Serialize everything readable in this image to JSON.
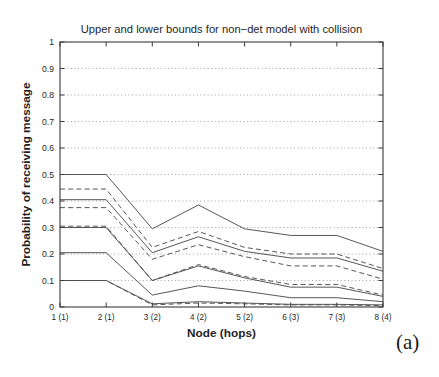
{
  "figure": {
    "caption": "(a)"
  },
  "chart_data": {
    "type": "line",
    "title": "Upper and lower bounds for non−det model with collision",
    "xlabel": "Node (hops)",
    "ylabel": "Probability of receiving message",
    "categories": [
      "1 (1)",
      "2 (1)",
      "3 (2)",
      "4 (2)",
      "5 (2)",
      "6 (3)",
      "7 (3)",
      "8 (4)"
    ],
    "x_tick_labels": [
      "1 (1)",
      "2 (1)",
      "3 (2)",
      "4 (2)",
      "5 (2)",
      "6 (3)",
      "7 (3)",
      "8 (4)"
    ],
    "y_tick_labels": [
      "0",
      "0.1",
      "0.2",
      "0.3",
      "0.4",
      "0.5",
      "0.6",
      "0.7",
      "0.8",
      "0.9",
      "1"
    ],
    "y_ticks": [
      0,
      0.1,
      0.2,
      0.3,
      0.4,
      0.5,
      0.6,
      0.7,
      0.8,
      0.9,
      1
    ],
    "ylim": [
      0,
      1
    ],
    "xlim": [
      1,
      8
    ],
    "grid": "horizontal-dotted",
    "legend": "none",
    "line_color": "#4d4d4d",
    "series": [
      {
        "name": "upper-bound-1",
        "style": "solid",
        "values": [
          0.5,
          0.5,
          0.295,
          0.385,
          0.295,
          0.27,
          0.27,
          0.21
        ]
      },
      {
        "name": "upper-bound-2",
        "style": "dashed",
        "values": [
          0.445,
          0.445,
          0.225,
          0.285,
          0.225,
          0.2,
          0.2,
          0.145
        ]
      },
      {
        "name": "upper-bound-3",
        "style": "solid",
        "values": [
          0.405,
          0.405,
          0.205,
          0.265,
          0.21,
          0.185,
          0.185,
          0.135
        ]
      },
      {
        "name": "upper-bound-4",
        "style": "dashed",
        "values": [
          0.375,
          0.375,
          0.18,
          0.235,
          0.19,
          0.155,
          0.155,
          0.105
        ]
      },
      {
        "name": "lower-bound-1",
        "style": "dashed",
        "values": [
          0.305,
          0.305,
          0.1,
          0.16,
          0.115,
          0.085,
          0.085,
          0.045
        ]
      },
      {
        "name": "lower-bound-2",
        "style": "solid",
        "values": [
          0.3,
          0.3,
          0.1,
          0.155,
          0.11,
          0.075,
          0.075,
          0.04
        ]
      },
      {
        "name": "lower-bound-3",
        "style": "solid",
        "values": [
          0.205,
          0.205,
          0.045,
          0.08,
          0.06,
          0.035,
          0.035,
          0.02
        ]
      },
      {
        "name": "lower-bound-4",
        "style": "solid",
        "values": [
          0.1,
          0.1,
          0.012,
          0.02,
          0.015,
          0.01,
          0.01,
          0.008
        ]
      },
      {
        "name": "lower-bound-5",
        "style": "dashed",
        "values": [
          0.1,
          0.1,
          0.008,
          0.015,
          0.012,
          0.008,
          0.008,
          0.005
        ]
      }
    ]
  }
}
